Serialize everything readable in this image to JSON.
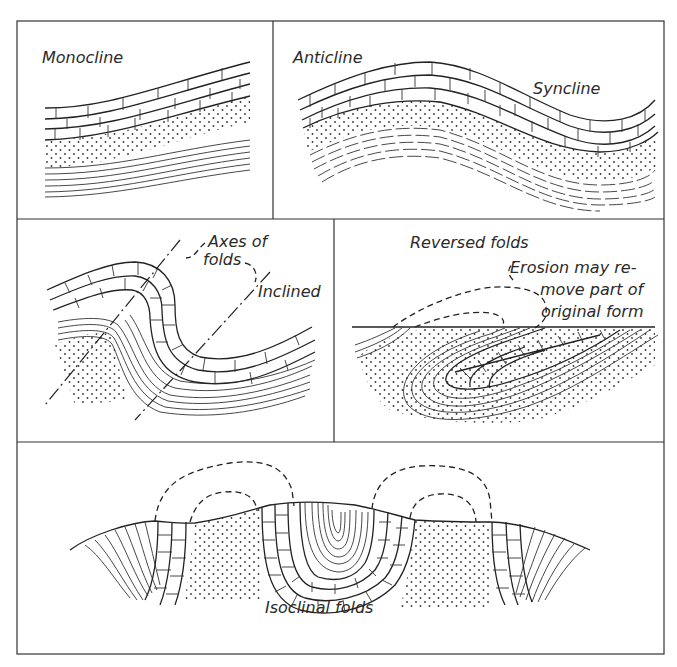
{
  "figure": {
    "panels": [
      {
        "id": "monocline",
        "labels": [
          "Monocline"
        ]
      },
      {
        "id": "anticline-syncline",
        "labels": [
          "Anticline",
          "Syncline"
        ]
      },
      {
        "id": "inclined",
        "labels": [
          "Axes of",
          "folds",
          "Inclined"
        ]
      },
      {
        "id": "reversed",
        "labels": [
          "Reversed folds",
          "Erosion may re-",
          "move part of",
          "original form"
        ]
      },
      {
        "id": "isoclinal",
        "labels": [
          "Isoclinal folds"
        ]
      }
    ],
    "legend_patterns": {
      "brick": "limestone",
      "dots": "sandstone",
      "lines": "shale"
    },
    "colors": {
      "ink": "#222222",
      "paper": "#ffffff"
    }
  }
}
